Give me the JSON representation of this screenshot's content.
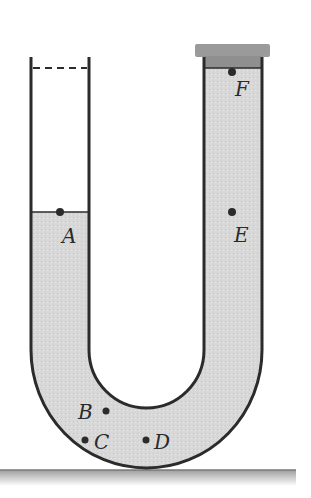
{
  "diagram": {
    "type": "u-tube-liquid-pressure",
    "colors": {
      "liquid": "#d6d6d6",
      "wall": "#2b2b2b",
      "cap": "#9a9a9a",
      "ground": "#bdbdbd",
      "background": "#ffffff"
    },
    "points": [
      {
        "id": "A",
        "label": "A",
        "description": "liquid surface, open left tube"
      },
      {
        "id": "B",
        "label": "B",
        "description": "bottom bend, inner"
      },
      {
        "id": "C",
        "label": "C",
        "description": "bottom bend, outer-left"
      },
      {
        "id": "D",
        "label": "D",
        "description": "bottom of tube"
      },
      {
        "id": "E",
        "label": "E",
        "description": "right tube, same level as A"
      },
      {
        "id": "F",
        "label": "F",
        "description": "top of liquid under cap, right tube"
      }
    ],
    "elements": {
      "left_tube": "open top (dashed line)",
      "right_tube": "sealed by cap",
      "ground": "horizontal surface"
    }
  }
}
